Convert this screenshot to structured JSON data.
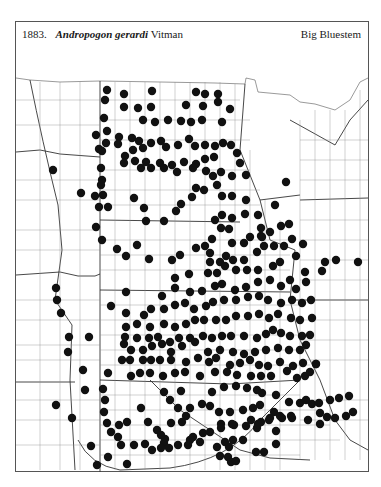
{
  "figure": {
    "number": "1883.",
    "genus_species": "Andropogon gerardi",
    "authority": "Vitman",
    "common_name": "Big Bluestem"
  },
  "map": {
    "type": "county dot distribution map",
    "region": "Great Plains, USA",
    "dot_color": "#111111",
    "line_color": "#555555",
    "dots": [
      [
        107,
        90
      ],
      [
        124,
        94
      ],
      [
        152,
        91
      ],
      [
        196,
        92
      ],
      [
        205,
        94
      ],
      [
        218,
        94
      ],
      [
        105,
        100
      ],
      [
        124,
        107
      ],
      [
        138,
        108
      ],
      [
        151,
        107
      ],
      [
        186,
        105
      ],
      [
        203,
        106
      ],
      [
        218,
        102
      ],
      [
        230,
        109
      ],
      [
        104,
        118
      ],
      [
        143,
        120
      ],
      [
        155,
        122
      ],
      [
        168,
        120
      ],
      [
        181,
        121
      ],
      [
        191,
        122
      ],
      [
        202,
        120
      ],
      [
        222,
        122
      ],
      [
        96,
        135
      ],
      [
        107,
        131
      ],
      [
        106,
        143
      ],
      [
        119,
        137
      ],
      [
        118,
        144
      ],
      [
        132,
        138
      ],
      [
        139,
        141
      ],
      [
        151,
        143
      ],
      [
        161,
        141
      ],
      [
        166,
        147
      ],
      [
        178,
        145
      ],
      [
        189,
        139
      ],
      [
        195,
        146
      ],
      [
        205,
        145
      ],
      [
        215,
        146
      ],
      [
        223,
        143
      ],
      [
        231,
        145
      ],
      [
        237,
        153
      ],
      [
        240,
        163
      ],
      [
        99,
        149
      ],
      [
        102,
        151
      ],
      [
        133,
        150
      ],
      [
        143,
        148
      ],
      [
        125,
        156
      ],
      [
        124,
        163
      ],
      [
        135,
        161
      ],
      [
        146,
        162
      ],
      [
        160,
        163
      ],
      [
        172,
        165
      ],
      [
        184,
        162
      ],
      [
        196,
        164
      ],
      [
        205,
        159
      ],
      [
        214,
        157
      ],
      [
        101,
        168
      ],
      [
        102,
        180
      ],
      [
        141,
        168
      ],
      [
        151,
        168
      ],
      [
        164,
        168
      ],
      [
        177,
        172
      ],
      [
        193,
        168
      ],
      [
        206,
        171
      ],
      [
        213,
        176
      ],
      [
        221,
        172
      ],
      [
        232,
        176
      ],
      [
        246,
        175
      ],
      [
        53,
        170
      ],
      [
        101,
        185
      ],
      [
        103,
        195
      ],
      [
        81,
        193
      ],
      [
        95,
        196
      ],
      [
        108,
        207
      ],
      [
        134,
        198
      ],
      [
        144,
        208
      ],
      [
        146,
        221
      ],
      [
        164,
        221
      ],
      [
        176,
        211
      ],
      [
        181,
        204
      ],
      [
        192,
        197
      ],
      [
        196,
        188
      ],
      [
        204,
        190
      ],
      [
        217,
        185
      ],
      [
        222,
        196
      ],
      [
        232,
        196
      ],
      [
        246,
        200
      ],
      [
        286,
        182
      ],
      [
        99,
        207
      ],
      [
        96,
        227
      ],
      [
        102,
        240
      ],
      [
        117,
        249
      ],
      [
        126,
        256
      ],
      [
        137,
        245
      ],
      [
        149,
        259
      ],
      [
        172,
        260
      ],
      [
        180,
        255
      ],
      [
        196,
        248
      ],
      [
        205,
        246
      ],
      [
        212,
        239
      ],
      [
        215,
        220
      ],
      [
        222,
        215
      ],
      [
        232,
        218
      ],
      [
        245,
        214
      ],
      [
        258,
        215
      ],
      [
        275,
        205
      ],
      [
        261,
        228
      ],
      [
        261,
        236
      ],
      [
        221,
        228
      ],
      [
        229,
        229
      ],
      [
        232,
        243
      ],
      [
        244,
        243
      ],
      [
        250,
        237
      ],
      [
        262,
        237
      ],
      [
        270,
        232
      ],
      [
        281,
        226
      ],
      [
        289,
        224
      ],
      [
        210,
        253
      ],
      [
        210,
        262
      ],
      [
        220,
        262
      ],
      [
        226,
        256
      ],
      [
        233,
        260
      ],
      [
        244,
        260
      ],
      [
        257,
        252
      ],
      [
        264,
        246
      ],
      [
        274,
        246
      ],
      [
        284,
        246
      ],
      [
        292,
        239
      ],
      [
        175,
        278
      ],
      [
        189,
        274
      ],
      [
        208,
        273
      ],
      [
        217,
        273
      ],
      [
        225,
        266
      ],
      [
        236,
        270
      ],
      [
        247,
        270
      ],
      [
        258,
        270
      ],
      [
        273,
        266
      ],
      [
        280,
        262
      ],
      [
        296,
        256
      ],
      [
        303,
        244
      ],
      [
        305,
        272
      ],
      [
        322,
        271
      ],
      [
        325,
        262
      ],
      [
        336,
        260
      ],
      [
        358,
        262
      ],
      [
        56,
        288
      ],
      [
        57,
        300
      ],
      [
        61,
        313
      ],
      [
        111,
        306
      ],
      [
        126,
        292
      ],
      [
        162,
        296
      ],
      [
        175,
        288
      ],
      [
        190,
        292
      ],
      [
        202,
        291
      ],
      [
        215,
        286
      ],
      [
        222,
        284
      ],
      [
        235,
        290
      ],
      [
        246,
        287
      ],
      [
        258,
        282
      ],
      [
        270,
        280
      ],
      [
        281,
        286
      ],
      [
        290,
        280
      ],
      [
        296,
        289
      ],
      [
        306,
        282
      ],
      [
        126,
        313
      ],
      [
        144,
        315
      ],
      [
        151,
        309
      ],
      [
        164,
        309
      ],
      [
        175,
        305
      ],
      [
        185,
        303
      ],
      [
        194,
        309
      ],
      [
        206,
        306
      ],
      [
        213,
        302
      ],
      [
        224,
        300
      ],
      [
        236,
        300
      ],
      [
        248,
        297
      ],
      [
        259,
        296
      ],
      [
        268,
        300
      ],
      [
        281,
        303
      ],
      [
        292,
        300
      ],
      [
        302,
        303
      ],
      [
        311,
        300
      ],
      [
        126,
        327
      ],
      [
        137,
        324
      ],
      [
        150,
        327
      ],
      [
        164,
        324
      ],
      [
        175,
        327
      ],
      [
        186,
        324
      ],
      [
        195,
        320
      ],
      [
        204,
        320
      ],
      [
        216,
        320
      ],
      [
        226,
        320
      ],
      [
        236,
        316
      ],
      [
        248,
        316
      ],
      [
        259,
        314
      ],
      [
        269,
        318
      ],
      [
        278,
        314
      ],
      [
        291,
        318
      ],
      [
        300,
        320
      ],
      [
        312,
        318
      ],
      [
        69,
        337
      ],
      [
        89,
        337
      ],
      [
        125,
        337
      ],
      [
        137,
        338
      ],
      [
        149,
        338
      ],
      [
        158,
        337
      ],
      [
        170,
        342
      ],
      [
        179,
        338
      ],
      [
        190,
        338
      ],
      [
        203,
        336
      ],
      [
        212,
        338
      ],
      [
        222,
        336
      ],
      [
        231,
        336
      ],
      [
        244,
        336
      ],
      [
        257,
        338
      ],
      [
        266,
        334
      ],
      [
        273,
        330
      ],
      [
        281,
        333
      ],
      [
        290,
        336
      ],
      [
        302,
        336
      ],
      [
        310,
        335
      ],
      [
        68,
        352
      ],
      [
        124,
        344
      ],
      [
        131,
        350
      ],
      [
        143,
        350
      ],
      [
        152,
        346
      ],
      [
        162,
        344
      ],
      [
        171,
        352
      ],
      [
        182,
        346
      ],
      [
        195,
        342
      ],
      [
        208,
        352
      ],
      [
        220,
        350
      ],
      [
        233,
        352
      ],
      [
        244,
        354
      ],
      [
        255,
        352
      ],
      [
        266,
        350
      ],
      [
        278,
        348
      ],
      [
        289,
        350
      ],
      [
        300,
        350
      ],
      [
        306,
        345
      ],
      [
        122,
        360
      ],
      [
        130,
        360
      ],
      [
        143,
        360
      ],
      [
        151,
        360
      ],
      [
        160,
        360
      ],
      [
        171,
        360
      ],
      [
        186,
        362
      ],
      [
        198,
        358
      ],
      [
        209,
        362
      ],
      [
        216,
        358
      ],
      [
        230,
        365
      ],
      [
        240,
        363
      ],
      [
        250,
        360
      ],
      [
        259,
        365
      ],
      [
        268,
        366
      ],
      [
        280,
        362
      ],
      [
        293,
        366
      ],
      [
        303,
        363
      ],
      [
        316,
        364
      ],
      [
        83,
        370
      ],
      [
        108,
        373
      ],
      [
        131,
        376
      ],
      [
        140,
        373
      ],
      [
        150,
        373
      ],
      [
        163,
        376
      ],
      [
        175,
        373
      ],
      [
        185,
        372
      ],
      [
        200,
        376
      ],
      [
        215,
        372
      ],
      [
        227,
        372
      ],
      [
        237,
        375
      ],
      [
        251,
        376
      ],
      [
        261,
        376
      ],
      [
        271,
        376
      ],
      [
        287,
        371
      ],
      [
        297,
        378
      ],
      [
        305,
        376
      ],
      [
        310,
        372
      ],
      [
        316,
        364
      ],
      [
        85,
        390
      ],
      [
        103,
        389
      ],
      [
        164,
        392
      ],
      [
        181,
        391
      ],
      [
        212,
        392
      ],
      [
        224,
        387
      ],
      [
        236,
        386
      ],
      [
        247,
        388
      ],
      [
        257,
        390
      ],
      [
        262,
        393
      ],
      [
        276,
        395
      ],
      [
        289,
        402
      ],
      [
        300,
        403
      ],
      [
        306,
        400
      ],
      [
        312,
        404
      ],
      [
        319,
        403
      ],
      [
        330,
        400
      ],
      [
        339,
        398
      ],
      [
        349,
        396
      ],
      [
        56,
        405
      ],
      [
        105,
        400
      ],
      [
        104,
        412
      ],
      [
        141,
        408
      ],
      [
        170,
        400
      ],
      [
        178,
        408
      ],
      [
        190,
        408
      ],
      [
        202,
        404
      ],
      [
        210,
        406
      ],
      [
        219,
        412
      ],
      [
        230,
        412
      ],
      [
        243,
        410
      ],
      [
        253,
        408
      ],
      [
        260,
        405
      ],
      [
        274,
        412
      ],
      [
        282,
        418
      ],
      [
        291,
        416
      ],
      [
        320,
        413
      ],
      [
        327,
        417
      ],
      [
        72,
        418
      ],
      [
        107,
        423
      ],
      [
        119,
        425
      ],
      [
        127,
        422
      ],
      [
        148,
        422
      ],
      [
        171,
        423
      ],
      [
        186,
        416
      ],
      [
        221,
        424
      ],
      [
        234,
        425
      ],
      [
        251,
        420
      ],
      [
        261,
        422
      ],
      [
        270,
        418
      ],
      [
        111,
        432
      ],
      [
        157,
        430
      ],
      [
        182,
        422
      ],
      [
        190,
        440
      ],
      [
        203,
        433
      ],
      [
        225,
        442
      ],
      [
        233,
        440
      ],
      [
        257,
        428
      ],
      [
        276,
        431
      ],
      [
        165,
        439
      ],
      [
        161,
        435
      ],
      [
        193,
        437
      ],
      [
        210,
        432
      ],
      [
        221,
        428
      ],
      [
        232,
        424
      ],
      [
        246,
        426
      ],
      [
        258,
        424
      ],
      [
        269,
        420
      ],
      [
        280,
        416
      ],
      [
        292,
        418
      ],
      [
        308,
        420
      ],
      [
        320,
        424
      ],
      [
        335,
        418
      ],
      [
        346,
        416
      ],
      [
        353,
        412
      ],
      [
        164,
        443
      ],
      [
        169,
        448
      ],
      [
        178,
        445
      ],
      [
        188,
        445
      ],
      [
        200,
        442
      ],
      [
        217,
        447
      ],
      [
        229,
        447
      ],
      [
        243,
        440
      ],
      [
        256,
        452
      ],
      [
        264,
        452
      ],
      [
        276,
        444
      ],
      [
        91,
        446
      ],
      [
        108,
        457
      ],
      [
        118,
        437
      ],
      [
        121,
        445
      ],
      [
        134,
        445
      ],
      [
        145,
        444
      ],
      [
        152,
        450
      ],
      [
        161,
        448
      ],
      [
        220,
        456
      ],
      [
        228,
        457
      ],
      [
        231,
        462
      ],
      [
        236,
        461
      ],
      [
        127,
        464
      ],
      [
        97,
        465
      ]
    ]
  }
}
